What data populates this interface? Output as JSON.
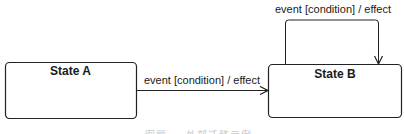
{
  "diagram": {
    "type": "UML state machine",
    "states": [
      {
        "id": "state-a",
        "name": "State A"
      },
      {
        "id": "state-b",
        "name": "State B"
      }
    ],
    "transitions": [
      {
        "from": "State A",
        "to": "State B",
        "label": "event [condition] / effect"
      },
      {
        "from": "State B",
        "to": "State B",
        "label": "event [condition] / effect",
        "kind": "self-transition"
      }
    ],
    "caption": "图题 — 外部迁移示例"
  },
  "colors": {
    "stroke": "#222222",
    "text": "#1a1a1a",
    "background": "#ffffff"
  }
}
